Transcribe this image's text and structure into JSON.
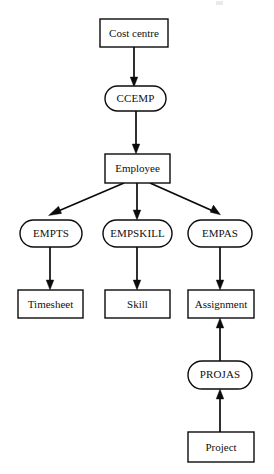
{
  "diagram": {
    "type": "entity-relationship-hierarchy",
    "background_color": "#ffffff",
    "line_color": "#0b0b0b",
    "text_color": "#101010",
    "entities": [
      {
        "id": "cost-centre",
        "label": "Cost centre",
        "shape": "rectangle",
        "x": 100,
        "y": 19,
        "w": 68,
        "h": 28
      },
      {
        "id": "employee",
        "label": "Employee",
        "shape": "rectangle",
        "x": 105,
        "y": 154,
        "w": 65,
        "h": 29
      },
      {
        "id": "timesheet",
        "label": "Timesheet",
        "shape": "rectangle",
        "x": 18,
        "y": 290,
        "w": 65,
        "h": 28
      },
      {
        "id": "skill",
        "label": "Skill",
        "shape": "rectangle",
        "x": 105,
        "y": 290,
        "w": 65,
        "h": 28
      },
      {
        "id": "assignment",
        "label": "Assignment",
        "shape": "rectangle",
        "x": 188,
        "y": 290,
        "w": 66,
        "h": 28
      },
      {
        "id": "project",
        "label": "Project",
        "shape": "rectangle",
        "x": 188,
        "y": 432,
        "w": 66,
        "h": 30
      }
    ],
    "relationships": [
      {
        "id": "ccemp",
        "label": "CCEMP",
        "shape": "stadium",
        "x": 105,
        "y": 86,
        "w": 61,
        "h": 25
      },
      {
        "id": "empts",
        "label": "EMPTS",
        "shape": "stadium",
        "x": 20,
        "y": 220,
        "w": 62,
        "h": 27
      },
      {
        "id": "empskill",
        "label": "EMPSKILL",
        "shape": "stadium",
        "x": 103,
        "y": 220,
        "w": 69,
        "h": 27
      },
      {
        "id": "empas",
        "label": "EMPAS",
        "shape": "stadium",
        "x": 188,
        "y": 220,
        "w": 64,
        "h": 27
      },
      {
        "id": "projas",
        "label": "PROJAS",
        "shape": "stadium",
        "x": 188,
        "y": 361,
        "w": 64,
        "h": 28
      }
    ],
    "edges": [
      {
        "id": "cost-centre-to-ccemp",
        "from": "cost-centre",
        "to": "ccemp",
        "direction": "down"
      },
      {
        "id": "ccemp-to-employee",
        "from": "ccemp",
        "to": "employee",
        "direction": "down"
      },
      {
        "id": "employee-to-empts",
        "from": "employee",
        "to": "empts",
        "direction": "down-left"
      },
      {
        "id": "employee-to-empskill",
        "from": "employee",
        "to": "empskill",
        "direction": "down"
      },
      {
        "id": "employee-to-empas",
        "from": "employee",
        "to": "empas",
        "direction": "down-right"
      },
      {
        "id": "empts-to-timesheet",
        "from": "empts",
        "to": "timesheet",
        "direction": "down"
      },
      {
        "id": "empskill-to-skill",
        "from": "empskill",
        "to": "skill",
        "direction": "down"
      },
      {
        "id": "empas-to-assignment",
        "from": "empas",
        "to": "assignment",
        "direction": "down"
      },
      {
        "id": "projas-to-assignment",
        "from": "projas",
        "to": "assignment",
        "direction": "up"
      },
      {
        "id": "project-to-projas",
        "from": "project",
        "to": "projas",
        "direction": "up"
      }
    ]
  }
}
